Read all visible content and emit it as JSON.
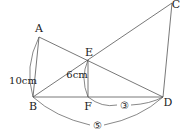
{
  "diagram": {
    "points": {
      "A": {
        "label": "A",
        "x": 39,
        "y": 37
      },
      "B": {
        "label": "B",
        "x": 33,
        "y": 97
      },
      "C": {
        "label": "C",
        "x": 172,
        "y": 3
      },
      "D": {
        "label": "D",
        "x": 163,
        "y": 97
      },
      "E": {
        "label": "E",
        "x": 88,
        "y": 60
      },
      "F": {
        "label": "F",
        "x": 88,
        "y": 97
      }
    },
    "segments": [
      [
        "A",
        "B"
      ],
      [
        "A",
        "D"
      ],
      [
        "B",
        "C"
      ],
      [
        "C",
        "D"
      ],
      [
        "B",
        "D"
      ],
      [
        "E",
        "F"
      ]
    ],
    "measurements": {
      "AB": "10cm",
      "EF": "6cm",
      "FD_ratio": "③",
      "BD_ratio": "⑤"
    },
    "colors": {
      "line": "#555555",
      "text": "#222222"
    }
  }
}
